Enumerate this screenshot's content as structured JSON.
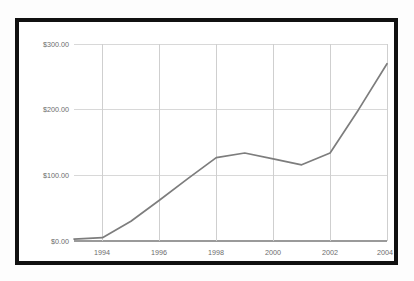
{
  "chart_data": {
    "type": "line",
    "title": "",
    "subtitle": "",
    "xlabel": "",
    "ylabel": "",
    "legend": [],
    "legend_position": "none",
    "grid": true,
    "x": [
      1993,
      1994,
      1995,
      1996,
      1997,
      1998,
      1999,
      2000,
      2001,
      2002,
      2003,
      2004
    ],
    "values": [
      3,
      5,
      30,
      62,
      95,
      127,
      134,
      125,
      116,
      134,
      200,
      270
    ],
    "series": [
      {
        "name": "value",
        "values": [
          3,
          5,
          30,
          62,
          95,
          127,
          134,
          125,
          116,
          134,
          200,
          270
        ],
        "color": "#7d7d7d"
      }
    ],
    "xlim": [
      1993,
      2004
    ],
    "ylim": [
      0,
      300
    ],
    "y_ticks": [
      0,
      100,
      200,
      300
    ],
    "y_tick_labels": [
      "$0.00",
      "$100.00",
      "$200.00",
      "$300.00"
    ],
    "x_ticks": [
      1994,
      1996,
      1998,
      2000,
      2002,
      2004
    ],
    "x_tick_labels": [
      "1994",
      "1996",
      "1998",
      "2000",
      "2002",
      "2004"
    ],
    "gridlines_vertical_at": [
      1994,
      1996,
      1998,
      2000,
      2002,
      2004
    ]
  },
  "colors": {
    "frame": "#111111",
    "plot_background": "#ffffff",
    "page_background": "#fdfdfd",
    "series": "#7d7d7d",
    "gridline": "#d8d8d8",
    "baseline": "#9a9a9a",
    "tick_text": "#6d6d6d"
  }
}
